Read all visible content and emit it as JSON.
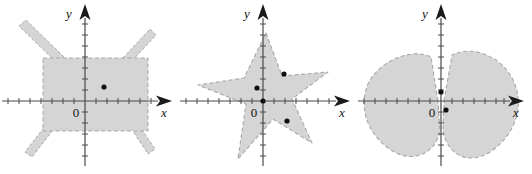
{
  "figure": {
    "caption": "",
    "background_color": "#ffffff",
    "region_fill_color": "#d5d5d5",
    "region_border_color": "#a8a8a8",
    "axis_color": "#4a4a4a",
    "point_color": "#101010"
  },
  "panels": [
    {
      "id": "rectangle-with-spikes",
      "axis": {
        "x_label": "x",
        "y_label": "y",
        "origin_label": "0"
      },
      "region": {
        "name": "rectangle-with-four-diagonal-spikes",
        "border_style": "dashed",
        "description": "Shaded rectangle centered near the origin with four thin diagonal spikes extending outward from the corners"
      },
      "points": [
        {
          "name": "interior-point-1",
          "cx": 104,
          "cy": 87
        }
      ]
    },
    {
      "id": "five-pointed-star",
      "axis": {
        "x_label": "x",
        "y_label": "y",
        "origin_label": "0"
      },
      "region": {
        "name": "five-pointed-star",
        "border_style": "dashed",
        "description": "Shaded five pointed star centered on the origin, slightly rotated"
      },
      "points": [
        {
          "name": "interior-point-1",
          "cx": 79,
          "cy": 88
        },
        {
          "name": "interior-point-2",
          "cx": 106,
          "cy": 74
        },
        {
          "name": "interior-point-3",
          "cx": 109,
          "cy": 121
        }
      ]
    },
    {
      "id": "two-lobed-cleft-region",
      "axis": {
        "x_label": "x",
        "y_label": "y",
        "origin_label": "0"
      },
      "region": {
        "name": "two-lobed-region-with-cleft-at-origin",
        "border_style": "dashed",
        "description": "Two large shaded lobes left and right of the y axis meeting in a narrow cleft at the origin"
      },
      "points": [
        {
          "name": "interior-point-1",
          "cx": 91,
          "cy": 97
        },
        {
          "name": "interior-point-2",
          "cx": 95,
          "cy": 110
        }
      ]
    }
  ]
}
